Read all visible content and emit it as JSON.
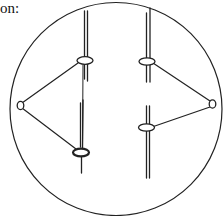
{
  "caption": "on:",
  "diagram": {
    "type": "cell-division-spindle",
    "stroke_color": "#222222",
    "background_color": "#ffffff",
    "elements": {
      "cell": "cell-membrane",
      "poles": [
        "left-spindle-pole",
        "right-spindle-pole"
      ],
      "chromosomes": [
        {
          "name": "left-upper-chromatid",
          "side": "left",
          "position": "upper"
        },
        {
          "name": "left-lower-chromatid",
          "side": "left",
          "position": "lower",
          "centromere_emphasized": true
        },
        {
          "name": "right-upper-chromatid",
          "side": "right",
          "position": "upper"
        },
        {
          "name": "right-lower-chromatid",
          "side": "right",
          "position": "lower"
        }
      ]
    }
  }
}
